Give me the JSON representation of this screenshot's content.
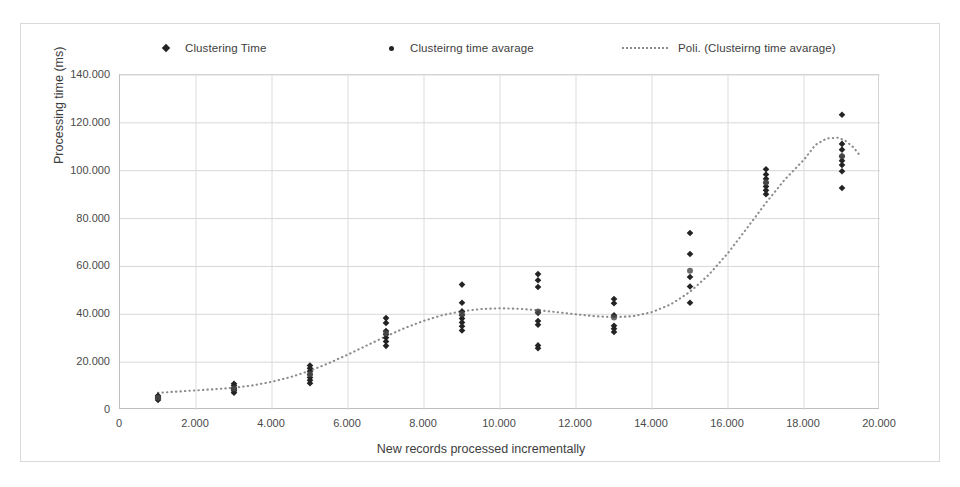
{
  "chart_data": {
    "type": "scatter",
    "title": "",
    "xlabel": "New records processed incrementally",
    "ylabel": "Processing time (ms)",
    "xlim": [
      0,
      20000
    ],
    "ylim": [
      0,
      140000
    ],
    "xticks": [
      "0",
      "2.000",
      "4.000",
      "6.000",
      "8.000",
      "10.000",
      "12.000",
      "14.000",
      "16.000",
      "18.000",
      "20.000"
    ],
    "xtick_values": [
      0,
      2000,
      4000,
      6000,
      8000,
      10000,
      12000,
      14000,
      16000,
      18000,
      20000
    ],
    "yticks": [
      "0",
      "20.000",
      "40.000",
      "60.000",
      "80.000",
      "100.000",
      "120.000",
      "140.000"
    ],
    "ytick_values": [
      0,
      20000,
      40000,
      60000,
      80000,
      100000,
      120000,
      140000
    ],
    "grid": true,
    "legend_position": "top",
    "legend": [
      {
        "label": "Clustering Time",
        "marker": "diamond",
        "color": "#232323"
      },
      {
        "label": "Clusteirng time avarage",
        "marker": "dot",
        "color": "#232323"
      },
      {
        "label": "Poli. (Clusteirng time avarage)",
        "marker": "dotted-line",
        "color": "#8c8c8c"
      }
    ],
    "series": [
      {
        "name": "Clustering Time",
        "marker": "diamond",
        "color": "#232323",
        "points": [
          {
            "x": 1000,
            "y": 4200
          },
          {
            "x": 1000,
            "y": 4900
          },
          {
            "x": 1000,
            "y": 5400
          },
          {
            "x": 1000,
            "y": 6000
          },
          {
            "x": 3000,
            "y": 7200
          },
          {
            "x": 3000,
            "y": 8000
          },
          {
            "x": 3000,
            "y": 8600
          },
          {
            "x": 3000,
            "y": 9200
          },
          {
            "x": 3000,
            "y": 10200
          },
          {
            "x": 3000,
            "y": 11000
          },
          {
            "x": 5000,
            "y": 11200
          },
          {
            "x": 5000,
            "y": 12400
          },
          {
            "x": 5000,
            "y": 13600
          },
          {
            "x": 5000,
            "y": 14800
          },
          {
            "x": 5000,
            "y": 16200
          },
          {
            "x": 5000,
            "y": 17400
          },
          {
            "x": 5000,
            "y": 18600
          },
          {
            "x": 7000,
            "y": 26800
          },
          {
            "x": 7000,
            "y": 28600
          },
          {
            "x": 7000,
            "y": 30200
          },
          {
            "x": 7000,
            "y": 31600
          },
          {
            "x": 7000,
            "y": 33000
          },
          {
            "x": 7000,
            "y": 36400
          },
          {
            "x": 7000,
            "y": 38400
          },
          {
            "x": 9000,
            "y": 33200
          },
          {
            "x": 9000,
            "y": 35000
          },
          {
            "x": 9000,
            "y": 36600
          },
          {
            "x": 9000,
            "y": 38200
          },
          {
            "x": 9000,
            "y": 39600
          },
          {
            "x": 9000,
            "y": 41200
          },
          {
            "x": 9000,
            "y": 44800
          },
          {
            "x": 9000,
            "y": 52400
          },
          {
            "x": 11000,
            "y": 25800
          },
          {
            "x": 11000,
            "y": 27000
          },
          {
            "x": 11000,
            "y": 35600
          },
          {
            "x": 11000,
            "y": 37200
          },
          {
            "x": 11000,
            "y": 40600
          },
          {
            "x": 11000,
            "y": 51400
          },
          {
            "x": 11000,
            "y": 54200
          },
          {
            "x": 11000,
            "y": 56800
          },
          {
            "x": 13000,
            "y": 32600
          },
          {
            "x": 13000,
            "y": 34000
          },
          {
            "x": 13000,
            "y": 35200
          },
          {
            "x": 13000,
            "y": 39600
          },
          {
            "x": 13000,
            "y": 44600
          },
          {
            "x": 13000,
            "y": 46400
          },
          {
            "x": 15000,
            "y": 44800
          },
          {
            "x": 15000,
            "y": 51600
          },
          {
            "x": 15000,
            "y": 55600
          },
          {
            "x": 15000,
            "y": 65200
          },
          {
            "x": 15000,
            "y": 74000
          },
          {
            "x": 17000,
            "y": 90200
          },
          {
            "x": 17000,
            "y": 91800
          },
          {
            "x": 17000,
            "y": 93400
          },
          {
            "x": 17000,
            "y": 95000
          },
          {
            "x": 17000,
            "y": 96600
          },
          {
            "x": 17000,
            "y": 98400
          },
          {
            "x": 17000,
            "y": 100600
          },
          {
            "x": 19000,
            "y": 92800
          },
          {
            "x": 19000,
            "y": 99800
          },
          {
            "x": 19000,
            "y": 102400
          },
          {
            "x": 19000,
            "y": 104200
          },
          {
            "x": 19000,
            "y": 106000
          },
          {
            "x": 19000,
            "y": 108800
          },
          {
            "x": 19000,
            "y": 111200
          },
          {
            "x": 19000,
            "y": 123400
          }
        ]
      },
      {
        "name": "Clusteirng time avarage",
        "marker": "dot",
        "color": "#4a4a4a",
        "points": [
          {
            "x": 1000,
            "y": 5100
          },
          {
            "x": 3000,
            "y": 9000
          },
          {
            "x": 5000,
            "y": 14900
          },
          {
            "x": 7000,
            "y": 32100
          },
          {
            "x": 9000,
            "y": 40100
          },
          {
            "x": 11000,
            "y": 41200
          },
          {
            "x": 13000,
            "y": 38700
          },
          {
            "x": 15000,
            "y": 58200
          },
          {
            "x": 17000,
            "y": 95100
          },
          {
            "x": 19000,
            "y": 106000
          }
        ]
      }
    ],
    "trendline": {
      "name": "Poli. (Clusteirng time avarage)",
      "style": "dotted",
      "color": "#8c8c8c",
      "points": [
        {
          "x": 1000,
          "y": 7200
        },
        {
          "x": 1500,
          "y": 7700
        },
        {
          "x": 2000,
          "y": 8200
        },
        {
          "x": 2500,
          "y": 8700
        },
        {
          "x": 3000,
          "y": 9300
        },
        {
          "x": 3500,
          "y": 10300
        },
        {
          "x": 4000,
          "y": 11800
        },
        {
          "x": 4500,
          "y": 13800
        },
        {
          "x": 5000,
          "y": 16400
        },
        {
          "x": 5500,
          "y": 19600
        },
        {
          "x": 6000,
          "y": 23200
        },
        {
          "x": 6500,
          "y": 27000
        },
        {
          "x": 7000,
          "y": 30800
        },
        {
          "x": 7500,
          "y": 34300
        },
        {
          "x": 8000,
          "y": 37300
        },
        {
          "x": 8500,
          "y": 39700
        },
        {
          "x": 9000,
          "y": 41300
        },
        {
          "x": 9500,
          "y": 42200
        },
        {
          "x": 10000,
          "y": 42500
        },
        {
          "x": 10500,
          "y": 42300
        },
        {
          "x": 11000,
          "y": 41700
        },
        {
          "x": 11500,
          "y": 40900
        },
        {
          "x": 12000,
          "y": 40000
        },
        {
          "x": 12500,
          "y": 39200
        },
        {
          "x": 13000,
          "y": 38800
        },
        {
          "x": 13500,
          "y": 39200
        },
        {
          "x": 14000,
          "y": 40900
        },
        {
          "x": 14500,
          "y": 44200
        },
        {
          "x": 15000,
          "y": 49400
        },
        {
          "x": 15500,
          "y": 56600
        },
        {
          "x": 16000,
          "y": 65600
        },
        {
          "x": 16500,
          "y": 76000
        },
        {
          "x": 17000,
          "y": 86600
        },
        {
          "x": 17500,
          "y": 96400
        },
        {
          "x": 18000,
          "y": 104600
        },
        {
          "x": 18300,
          "y": 110800
        },
        {
          "x": 18600,
          "y": 113500
        },
        {
          "x": 18900,
          "y": 113800
        },
        {
          "x": 19100,
          "y": 112400
        },
        {
          "x": 19300,
          "y": 109800
        },
        {
          "x": 19450,
          "y": 106800
        }
      ]
    }
  }
}
